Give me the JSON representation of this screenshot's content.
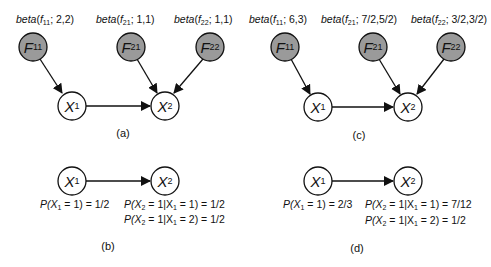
{
  "colors": {
    "factor_fill": "#9a9a9a",
    "variable_fill": "#ffffff",
    "stroke": "#111111",
    "background": "#ffffff"
  },
  "panels": {
    "a": {
      "caption": "(a)",
      "priors": [
        {
          "fn": "beta",
          "var": "f",
          "sub": "11",
          "params": "; 2,2)"
        },
        {
          "fn": "beta",
          "var": "f",
          "sub": "21",
          "params": "; 1,1)"
        },
        {
          "fn": "beta",
          "var": "f",
          "sub": "22",
          "params": "; 1,1)"
        }
      ],
      "nodes": {
        "F11": {
          "letter": "F",
          "sub": "11"
        },
        "F21": {
          "letter": "F",
          "sub": "21"
        },
        "F22": {
          "letter": "F",
          "sub": "22"
        },
        "X1": {
          "letter": "X",
          "sub": "1"
        },
        "X2": {
          "letter": "X",
          "sub": "2"
        }
      }
    },
    "b": {
      "caption": "(b)",
      "nodes": {
        "X1": {
          "letter": "X",
          "sub": "1"
        },
        "X2": {
          "letter": "X",
          "sub": "2"
        }
      },
      "probs": {
        "p_x1": {
          "lhs": "P(X",
          "sub": "1",
          "rhs": " = 1) = 1/2"
        },
        "p_x2_given_1": {
          "lhs": "P(X",
          "sub": "2",
          "mid": " = 1|X",
          "sub2": "1",
          "rhs": " = 1) = 1/2"
        },
        "p_x2_given_2": {
          "lhs": "P(X",
          "sub": "2",
          "mid": " = 1|X",
          "sub2": "1",
          "rhs": " = 2) = 1/2"
        }
      }
    },
    "c": {
      "caption": "(c)",
      "priors": [
        {
          "fn": "beta",
          "var": "f",
          "sub": "11",
          "params": "; 6,3)"
        },
        {
          "fn": "beta",
          "var": "f",
          "sub": "21",
          "params": "; 7/2,5/2)"
        },
        {
          "fn": "beta",
          "var": "f",
          "sub": "22",
          "params": "; 3/2,3/2)"
        }
      ],
      "nodes": {
        "F11": {
          "letter": "F",
          "sub": "11"
        },
        "F21": {
          "letter": "F",
          "sub": "21"
        },
        "F22": {
          "letter": "F",
          "sub": "22"
        },
        "X1": {
          "letter": "X",
          "sub": "1"
        },
        "X2": {
          "letter": "X",
          "sub": "2"
        }
      }
    },
    "d": {
      "caption": "(d)",
      "nodes": {
        "X1": {
          "letter": "X",
          "sub": "1"
        },
        "X2": {
          "letter": "X",
          "sub": "2"
        }
      },
      "probs": {
        "p_x1": {
          "lhs": "P(X",
          "sub": "1",
          "rhs": " = 1) = 2/3"
        },
        "p_x2_given_1": {
          "lhs": "P(X",
          "sub": "2",
          "mid": " = 1|X",
          "sub2": "1",
          "rhs": " = 1) = 7/12"
        },
        "p_x2_given_2": {
          "lhs": "P(X",
          "sub": "2",
          "mid": " = 1|X",
          "sub2": "1",
          "rhs": " = 2) = 1/2"
        }
      }
    }
  }
}
